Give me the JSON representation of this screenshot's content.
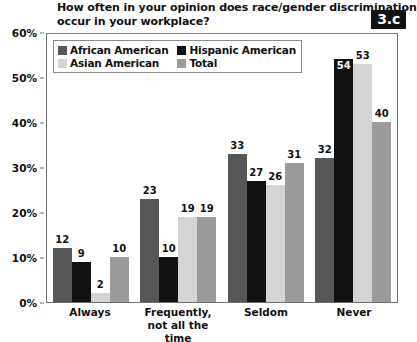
{
  "title": {
    "lines": [
      "How often in your opinion does race/gender discrimination",
      "occur in your workplace?"
    ]
  },
  "badge": {
    "label": "3.c"
  },
  "legend": {
    "items": [
      {
        "label": "African American",
        "color": "#575757"
      },
      {
        "label": "Hispanic American",
        "color": "#111111"
      },
      {
        "label": "Asian American",
        "color": "#d4d4d4"
      },
      {
        "label": "Total",
        "color": "#9b9b9b"
      }
    ]
  },
  "axis": {
    "y_ticks": [
      "0%",
      "10%",
      "20%",
      "30%",
      "40%",
      "50%",
      "60%"
    ]
  },
  "chart_data": {
    "type": "bar",
    "title": "How often in your opinion does race/gender discrimination occur in your workplace?",
    "xlabel": "",
    "ylabel": "",
    "ylim": [
      0,
      60
    ],
    "ytick_values": [
      0,
      10,
      20,
      30,
      40,
      50,
      60
    ],
    "ytick_labels": [
      "0%",
      "10%",
      "20%",
      "30%",
      "40%",
      "50%",
      "60%"
    ],
    "grid": false,
    "legend_position": "top-left-inside",
    "categories": [
      "Always",
      "Frequently, not all the time",
      "Seldom",
      "Never"
    ],
    "category_lines": [
      [
        "Always"
      ],
      [
        "Frequently,",
        "not all the time"
      ],
      [
        "Seldom"
      ],
      [
        "Never"
      ]
    ],
    "series": [
      {
        "name": "African American",
        "color": "#575757",
        "values": [
          12,
          23,
          33,
          32
        ]
      },
      {
        "name": "Hispanic American",
        "color": "#111111",
        "values": [
          9,
          10,
          27,
          54
        ]
      },
      {
        "name": "Asian American",
        "color": "#d4d4d4",
        "values": [
          2,
          19,
          26,
          53
        ]
      },
      {
        "name": "Total",
        "color": "#9b9b9b",
        "values": [
          10,
          19,
          31,
          40
        ]
      }
    ]
  }
}
